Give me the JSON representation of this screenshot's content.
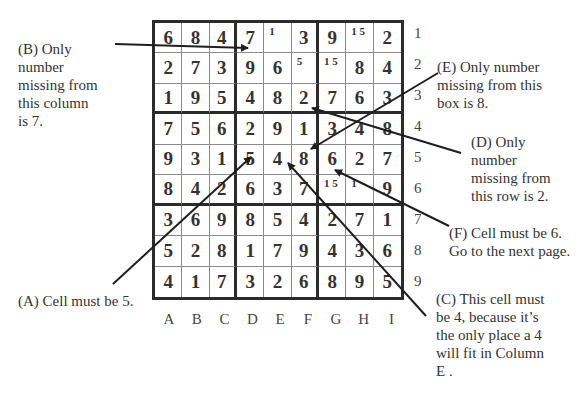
{
  "grid": {
    "rows": [
      [
        {
          "v": "6"
        },
        {
          "v": "8"
        },
        {
          "v": "4"
        },
        {
          "v": "7"
        },
        {
          "v": "",
          "note": "1"
        },
        {
          "v": "3"
        },
        {
          "v": "9"
        },
        {
          "v": "",
          "note": "1 5"
        },
        {
          "v": "2"
        }
      ],
      [
        {
          "v": "2"
        },
        {
          "v": "7"
        },
        {
          "v": "3"
        },
        {
          "v": "9"
        },
        {
          "v": "6"
        },
        {
          "v": "",
          "note": "5"
        },
        {
          "v": "",
          "note": "1 5"
        },
        {
          "v": "8"
        },
        {
          "v": "4"
        }
      ],
      [
        {
          "v": "1"
        },
        {
          "v": "9"
        },
        {
          "v": "5"
        },
        {
          "v": "4"
        },
        {
          "v": "8"
        },
        {
          "v": "2"
        },
        {
          "v": "7"
        },
        {
          "v": "6"
        },
        {
          "v": "3"
        }
      ],
      [
        {
          "v": "7"
        },
        {
          "v": "5"
        },
        {
          "v": "6"
        },
        {
          "v": "2"
        },
        {
          "v": "9"
        },
        {
          "v": "1"
        },
        {
          "v": "3"
        },
        {
          "v": "4"
        },
        {
          "v": "8"
        }
      ],
      [
        {
          "v": "9"
        },
        {
          "v": "3"
        },
        {
          "v": "1"
        },
        {
          "v": "5"
        },
        {
          "v": "4"
        },
        {
          "v": "8"
        },
        {
          "v": "6"
        },
        {
          "v": "2"
        },
        {
          "v": "7"
        }
      ],
      [
        {
          "v": "8"
        },
        {
          "v": "4"
        },
        {
          "v": "2"
        },
        {
          "v": "6"
        },
        {
          "v": "3"
        },
        {
          "v": "7"
        },
        {
          "v": "",
          "note": "1 5"
        },
        {
          "v": "",
          "note": "1"
        },
        {
          "v": "9"
        }
      ],
      [
        {
          "v": "3"
        },
        {
          "v": "6"
        },
        {
          "v": "9"
        },
        {
          "v": "8"
        },
        {
          "v": "5"
        },
        {
          "v": "4"
        },
        {
          "v": "2"
        },
        {
          "v": "7"
        },
        {
          "v": "1"
        }
      ],
      [
        {
          "v": "5"
        },
        {
          "v": "2"
        },
        {
          "v": "8"
        },
        {
          "v": "1"
        },
        {
          "v": "7"
        },
        {
          "v": "9"
        },
        {
          "v": "4"
        },
        {
          "v": "3"
        },
        {
          "v": "6"
        }
      ],
      [
        {
          "v": "4"
        },
        {
          "v": "1"
        },
        {
          "v": "7"
        },
        {
          "v": "3"
        },
        {
          "v": "2"
        },
        {
          "v": "6"
        },
        {
          "v": "8"
        },
        {
          "v": "9"
        },
        {
          "v": "5"
        }
      ]
    ],
    "row_labels": [
      "1",
      "2",
      "3",
      "4",
      "5",
      "6",
      "7",
      "8",
      "9"
    ],
    "col_labels": [
      "A",
      "B",
      "C",
      "D",
      "E",
      "F",
      "G",
      "H",
      "I"
    ]
  },
  "annotations": {
    "A": "(A) Cell must be 5.",
    "B_lines": [
      "(B) Only",
      "number",
      "missing from",
      "this column",
      "is 7."
    ],
    "C_lines": [
      "(C) This cell must",
      "be 4, because it’s",
      "the only place a 4",
      "will fit in Column",
      "E ."
    ],
    "D_lines": [
      "(D) Only",
      "number",
      "missing from",
      "this row is 2."
    ],
    "E_lines": [
      "(E) Only number",
      "missing from this",
      "box is 8."
    ],
    "F_lines": [
      "(F) Cell must be 6.",
      "Go to the next page."
    ]
  }
}
